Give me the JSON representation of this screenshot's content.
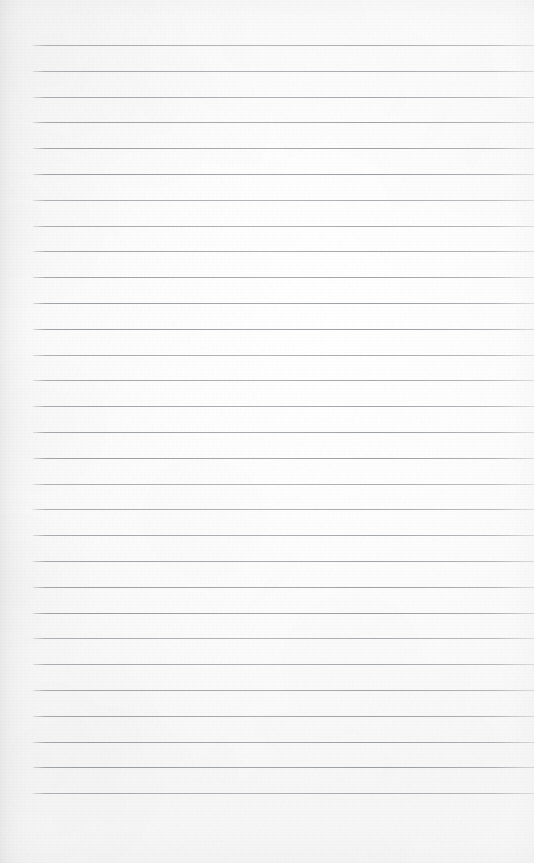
{
  "document": {
    "kind": "blank-lined-notebook-page",
    "page_width": 534,
    "page_height": 863,
    "paper_color": "#fbfbfc",
    "rule_color": "#969ba0",
    "text_content": "",
    "has_text": false,
    "has_margin_rule": false,
    "has_holes": false,
    "header_text": "",
    "footer_text": "",
    "page_number": ""
  },
  "ruling": {
    "line_count": 30,
    "first_line_y": 45,
    "line_spacing": 25.8,
    "line_start_x": 33,
    "line_end_x": 534,
    "line_thickness": 1,
    "lines_y": [
      45,
      70.8,
      96.6,
      122.4,
      148.2,
      174,
      199.8,
      225.6,
      251.4,
      277.2,
      303,
      328.8,
      354.6,
      380.4,
      406.2,
      432,
      457.8,
      483.6,
      509.4,
      535.2,
      561,
      586.8,
      612.6,
      638.4,
      664.2,
      690,
      715.8,
      741.6,
      767.4,
      793.2
    ]
  },
  "margins": {
    "top_margin_px": 45,
    "left_margin_px": 33,
    "right_margin_px": 0,
    "bottom_margin_px": 61
  }
}
